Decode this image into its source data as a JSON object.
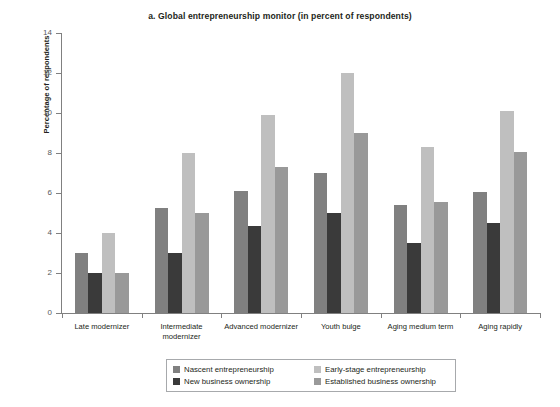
{
  "chart_data": {
    "type": "bar",
    "title": "a. Global entrepreneurship monitor (in percent of respondents)",
    "xlabel": "",
    "ylabel": "Percentage of respondents",
    "ylim": [
      0,
      14
    ],
    "ytick_step": 2,
    "yticks": [
      "0",
      "2",
      "4",
      "6",
      "8",
      "10",
      "12",
      "14"
    ],
    "grid": false,
    "legend_position": "bottom",
    "categories": [
      "Late modernizer",
      "Intermediate modernizer",
      "Advanced modernizer",
      "Youth bulge",
      "Aging medium term",
      "Aging rapidly"
    ],
    "series": [
      {
        "name": "Nascent entrepreneurship",
        "color": "#808080",
        "values": [
          3.0,
          5.25,
          6.1,
          7.0,
          5.4,
          6.05
        ]
      },
      {
        "name": "New business ownership",
        "color": "#3a3a3a",
        "values": [
          2.0,
          3.0,
          4.35,
          5.0,
          3.5,
          4.5
        ]
      },
      {
        "name": "Early-stage entrepreneurship",
        "color": "#bfbfbf",
        "values": [
          4.0,
          8.0,
          9.9,
          12.0,
          8.3,
          10.1
        ]
      },
      {
        "name": "Established business ownership",
        "color": "#999999",
        "values": [
          2.0,
          5.0,
          7.3,
          9.0,
          5.55,
          8.05
        ]
      }
    ]
  },
  "legend": {
    "order": [
      "Nascent entrepreneurship",
      "Early-stage entrepreneurship",
      "New business ownership",
      "Established business ownership"
    ]
  }
}
